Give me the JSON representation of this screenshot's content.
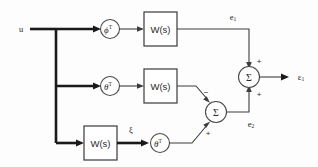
{
  "diagram": {
    "background_color": "#fdfdfd",
    "line_color": "#3d3d3d",
    "bold_line_color": "#1a1a1a"
  },
  "inputs": {
    "u_label": "u"
  },
  "blocks": [
    {
      "id": "w_top",
      "label": "W(s)",
      "row": "top"
    },
    {
      "id": "w_mid",
      "label": "W(s)",
      "row": "middle"
    },
    {
      "id": "w_bottom",
      "label": "W(s)",
      "row": "bottom"
    }
  ],
  "gains": [
    {
      "id": "gain_phi_t",
      "symbol": "ϕ",
      "superscript": "T",
      "row": "top"
    },
    {
      "id": "gain_theta_t_mid",
      "symbol": "θ",
      "superscript": "T",
      "row": "middle"
    },
    {
      "id": "gain_theta_t_bottom",
      "symbol": "θ",
      "superscript": "T",
      "row": "bottom"
    }
  ],
  "summers": [
    {
      "id": "summer_right",
      "symbol": "Σ",
      "top_sign": "+",
      "bottom_sign": "+"
    },
    {
      "id": "summer_middle",
      "symbol": "Σ",
      "upper_input_sign": "−",
      "lower_input_sign": "+"
    }
  ],
  "signals": {
    "e1": {
      "base": "e",
      "sub": "1"
    },
    "e2": {
      "base": "e",
      "sub": "2"
    },
    "epsilon1": {
      "base": "ε",
      "sub": "1"
    },
    "xi": "ξ"
  }
}
